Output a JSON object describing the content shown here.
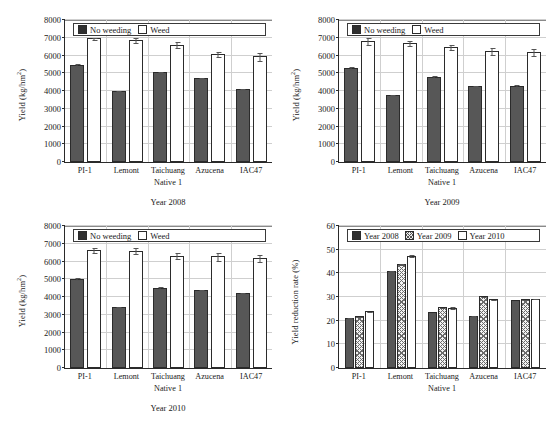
{
  "figure": {
    "categories": [
      "PI-1",
      "Lemont",
      "Taichuang",
      "Azucena",
      "IAC47"
    ],
    "category_sub": "Native 1"
  },
  "chart_data": [
    {
      "type": "bar",
      "title": "Year 2008",
      "xlabel": "",
      "ylabel": "Yield (kg/hm²)",
      "ylabel_base": "Yield (kg/hm",
      "ylabel_sup": "2",
      "ylabel_tail": ")",
      "ylim": [
        0,
        8000
      ],
      "yticks": [
        0,
        1000,
        2000,
        3000,
        4000,
        5000,
        6000,
        7000,
        8000
      ],
      "grid": true,
      "legend_position": "top-left",
      "categories": [
        "PI-1",
        "Lemont",
        "Taichuang",
        "Azucena",
        "IAC47"
      ],
      "series": [
        {
          "name": "No weeding",
          "fill": "dark",
          "values": [
            5450,
            3990,
            5050,
            4730,
            4130
          ],
          "errors": [
            180,
            130,
            150,
            110,
            130
          ]
        },
        {
          "name": "Weed",
          "fill": "white",
          "values": [
            6960,
            6880,
            6610,
            6080,
            5950
          ],
          "errors": [
            130,
            220,
            230,
            230,
            330
          ]
        }
      ]
    },
    {
      "type": "bar",
      "title": "Year 2009",
      "xlabel": "",
      "ylabel": "Yield (kg/hm²)",
      "ylabel_base": "Yield (kg/hm",
      "ylabel_sup": "2",
      "ylabel_tail": ")",
      "ylim": [
        0,
        8000
      ],
      "yticks": [
        0,
        1000,
        2000,
        3000,
        4000,
        5000,
        6000,
        7000,
        8000
      ],
      "grid": true,
      "legend_position": "top-left",
      "categories": [
        "PI-1",
        "Lemont",
        "Taichuang",
        "Azucena",
        "IAC47"
      ],
      "series": [
        {
          "name": "No weeding",
          "fill": "dark",
          "values": [
            5300,
            3760,
            4800,
            4260,
            4280
          ],
          "errors": [
            150,
            110,
            150,
            190,
            180
          ]
        },
        {
          "name": "Weed",
          "fill": "white",
          "values": [
            6810,
            6700,
            6490,
            6250,
            6180
          ],
          "errors": [
            260,
            190,
            230,
            300,
            300
          ]
        }
      ]
    },
    {
      "type": "bar",
      "title": "Year 2010",
      "xlabel": "",
      "ylabel": "Yield (kg/hm²)",
      "ylabel_base": "Yield (kg/hm",
      "ylabel_sup": "2",
      "ylabel_tail": ")",
      "ylim": [
        0,
        8000
      ],
      "yticks": [
        0,
        1000,
        2000,
        3000,
        4000,
        5000,
        6000,
        7000,
        8000
      ],
      "grid": true,
      "legend_position": "top-left",
      "categories": [
        "PI-1",
        "Lemont",
        "Taichuang",
        "Azucena",
        "IAC47"
      ],
      "series": [
        {
          "name": "No weeding",
          "fill": "dark",
          "values": [
            5030,
            3420,
            4530,
            4390,
            4230
          ],
          "errors": [
            160,
            140,
            160,
            130,
            150
          ]
        },
        {
          "name": "Weed",
          "fill": "white",
          "values": [
            6660,
            6610,
            6330,
            6300,
            6190
          ],
          "errors": [
            200,
            230,
            270,
            330,
            290
          ]
        }
      ]
    },
    {
      "type": "bar",
      "title": "",
      "xlabel": "",
      "ylabel": "Yield reduction rate (%)",
      "ylim": [
        0,
        60
      ],
      "yticks": [
        0,
        10,
        20,
        30,
        40,
        50,
        60
      ],
      "grid": true,
      "legend_position": "top-left",
      "categories": [
        "PI-1",
        "Lemont",
        "Taichuang",
        "Azucena",
        "IAC47"
      ],
      "series": [
        {
          "name": "Year 2008",
          "fill": "dark",
          "values": [
            21.0,
            41.0,
            23.5,
            22.0,
            28.6
          ],
          "errors": [
            1.2,
            0.9,
            0.8,
            0.7,
            0.6
          ]
        },
        {
          "name": "Year 2009",
          "fill": "hatch",
          "values": [
            21.8,
            44.0,
            25.7,
            30.3,
            29.0
          ],
          "errors": [
            1.0,
            0.8,
            0.7,
            0.5,
            0.6
          ]
        },
        {
          "name": "Year 2010",
          "fill": "white",
          "values": [
            24.0,
            47.5,
            25.5,
            29.0,
            29.3
          ],
          "errors": [
            0.5,
            0.7,
            1.3,
            0.6,
            0.5
          ]
        }
      ]
    }
  ]
}
